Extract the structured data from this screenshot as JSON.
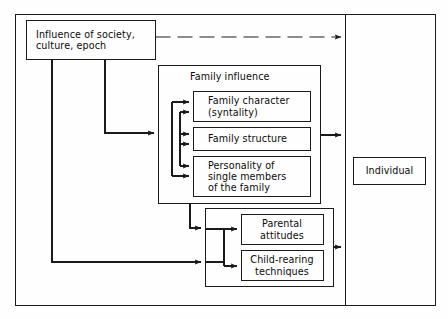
{
  "figure": {
    "type": "block-diagram",
    "colors": {
      "line": "#1a1a1a",
      "text": "#0b0b0b",
      "background": "#fefefe"
    }
  },
  "outer_frame": {
    "name": "diagram-outer-frame"
  },
  "divider": {
    "name": "vertical-divider"
  },
  "nodes": {
    "society": {
      "label": "Influence of society,\nculture, epoch"
    },
    "family_group": {
      "label": "Family influence"
    },
    "family_character": {
      "label": "Family character\n(syntality)"
    },
    "family_structure": {
      "label": "Family structure"
    },
    "personality": {
      "label": "Personality of\nsingle members\nof the family"
    },
    "parental_attitudes": {
      "label": "Parental\nattitudes"
    },
    "child_rearing": {
      "label": "Child-rearing\ntechniques"
    },
    "individual": {
      "label": "Individual"
    }
  },
  "connectors": [
    {
      "name": "society-to-individual-dashed",
      "style": "dashed",
      "from": "society",
      "to": "individual-panel"
    },
    {
      "name": "society-to-family-influence",
      "style": "solid",
      "from": "society",
      "to": "family_group"
    },
    {
      "name": "society-to-parental-group",
      "style": "solid",
      "from": "society",
      "to": "parental_group"
    },
    {
      "name": "family-group-to-individual-panel",
      "style": "solid",
      "from": "family_group",
      "to": "individual-panel"
    },
    {
      "name": "family-group-to-parental-group",
      "style": "solid",
      "from": "family_group",
      "to": "parental_group"
    },
    {
      "name": "parental-group-to-individual-panel",
      "style": "solid",
      "from": "parental_group",
      "to": "individual-panel"
    },
    {
      "name": "family-internal-bus",
      "style": "solid",
      "from": "family-members",
      "to": "family-members"
    },
    {
      "name": "parental-internal-bus",
      "style": "solid",
      "from": "parental-members",
      "to": "parental-members"
    }
  ]
}
